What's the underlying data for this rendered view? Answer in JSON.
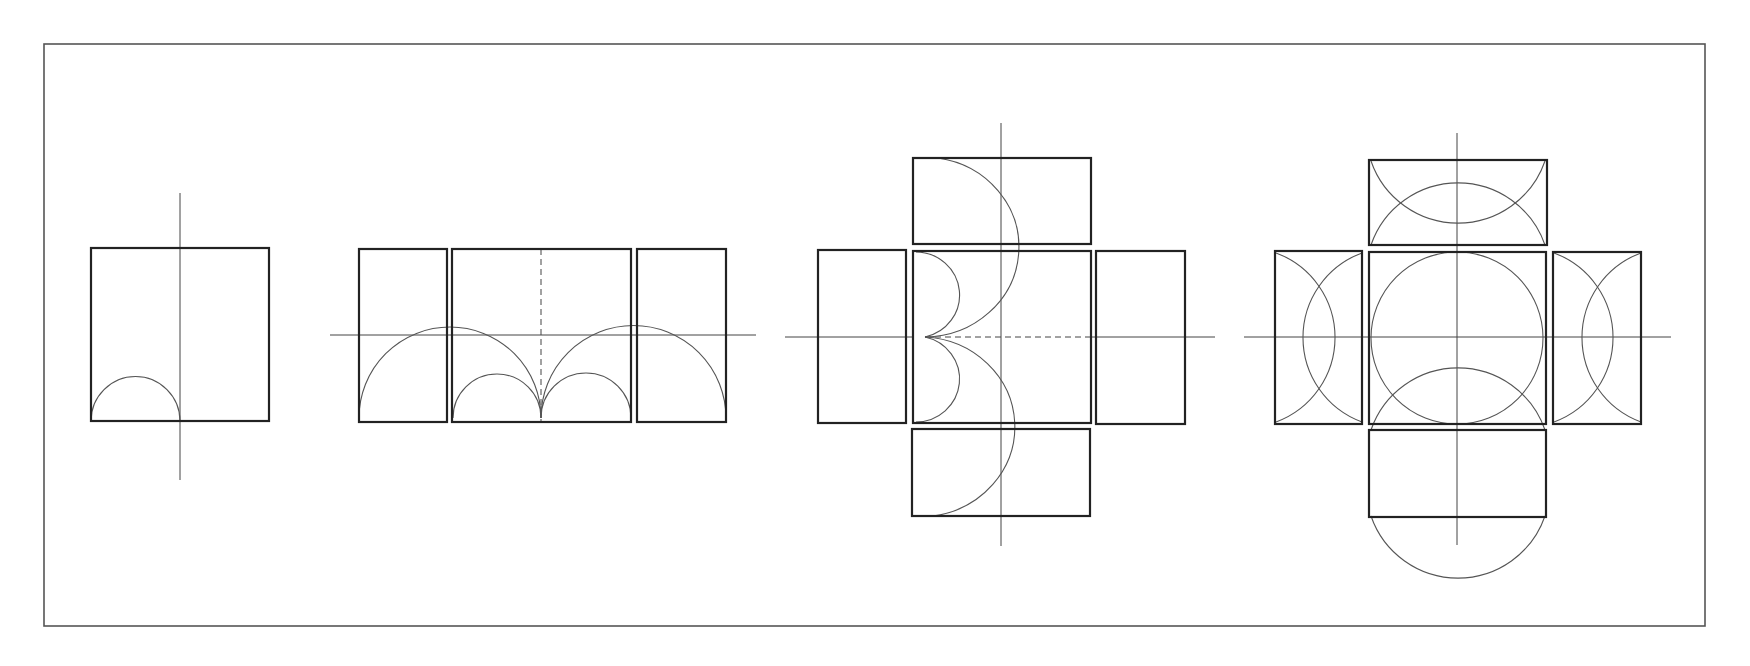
{
  "figure": {
    "title": "Geometric construction: box nets with arcs and circles",
    "frame": {
      "x": 44,
      "y": 44,
      "w": 1661,
      "h": 582
    },
    "panels": [
      {
        "id": "panel-1",
        "label": "single square with half-arc",
        "boxes": [
          {
            "x": 91,
            "y": 248,
            "w": 178,
            "h": 173
          }
        ],
        "axes": [
          {
            "x1": 180,
            "y1": 193,
            "x2": 180,
            "y2": 480,
            "style": "solid"
          }
        ],
        "arcs": [
          "M 91 421 A 44 44 0 0 1 180 421"
        ]
      },
      {
        "id": "panel-2",
        "label": "row of three boxes with semicircles",
        "boxes": [
          {
            "x": 359,
            "y": 249,
            "w": 88,
            "h": 173
          },
          {
            "x": 452,
            "y": 249,
            "w": 179,
            "h": 173
          },
          {
            "x": 637,
            "y": 249,
            "w": 89,
            "h": 173
          }
        ],
        "axes": [
          {
            "x1": 330,
            "y1": 335,
            "x2": 756,
            "y2": 335,
            "style": "solid"
          },
          {
            "x1": 541,
            "y1": 249,
            "x2": 541,
            "y2": 422,
            "style": "dashed"
          }
        ],
        "arcs": [
          "M 359 418 A 91 91 0 0 1 541 418",
          "M 541 418 A 92 92 0 0 1 726 418",
          "M 453 418 A 44 44 0 0 1 541 418",
          "M 541 418 A 45 45 0 0 1 631 418"
        ]
      },
      {
        "id": "panel-3",
        "label": "cross net with side arcs",
        "boxes": [
          {
            "x": 913,
            "y": 158,
            "w": 178,
            "h": 86
          },
          {
            "x": 818,
            "y": 250,
            "w": 88,
            "h": 173
          },
          {
            "x": 913,
            "y": 251,
            "w": 178,
            "h": 172
          },
          {
            "x": 1096,
            "y": 251,
            "w": 89,
            "h": 173
          },
          {
            "x": 912,
            "y": 429,
            "w": 178,
            "h": 87
          }
        ],
        "axes": [
          {
            "x1": 1001,
            "y1": 123,
            "x2": 1001,
            "y2": 546,
            "style": "solid"
          },
          {
            "x1": 785,
            "y1": 337,
            "x2": 913,
            "y2": 337,
            "style": "solid"
          },
          {
            "x1": 925,
            "y1": 337,
            "x2": 1091,
            "y2": 337,
            "style": "dashed"
          },
          {
            "x1": 1091,
            "y1": 337,
            "x2": 1215,
            "y2": 337,
            "style": "solid"
          }
        ],
        "arcs": [
          "M 916 252 A 44 43 0 0 1 925 337",
          "M 925 337 A 44 43 0 0 1 916 422",
          "M 938 158 A 95 90 0 0 1 925 337",
          "M 925 337 A 95 90 0 0 1 933 516"
        ]
      },
      {
        "id": "panel-4",
        "label": "cross net with inscribed circles",
        "boxes": [
          {
            "x": 1369,
            "y": 160,
            "w": 178,
            "h": 85
          },
          {
            "x": 1275,
            "y": 251,
            "w": 87,
            "h": 173
          },
          {
            "x": 1369,
            "y": 252,
            "w": 177,
            "h": 172
          },
          {
            "x": 1553,
            "y": 252,
            "w": 88,
            "h": 172
          },
          {
            "x": 1369,
            "y": 430,
            "w": 177,
            "h": 87
          }
        ],
        "axes": [
          {
            "x1": 1457,
            "y1": 133,
            "x2": 1457,
            "y2": 545,
            "style": "solid"
          },
          {
            "x1": 1244,
            "y1": 337,
            "x2": 1671,
            "y2": 337,
            "style": "solid"
          }
        ],
        "circles": [
          {
            "cx": 1457,
            "cy": 338,
            "r": 86
          }
        ],
        "arcs": [
          "M 1371 245 A 92 92 0 0 1 1545 245",
          "M 1371 161 A 92 92 0 0 0 1545 161",
          "M 1371 430 A 92 92 0 0 1 1545 430",
          "M 1371 516 A 92 92 0 0 0 1545 516",
          "M 1362 253 A 90 90 0 0 0 1362 422",
          "M 1276 253 A 90 90 0 0 1 1276 422",
          "M 1641 253 A 90 90 0 0 0 1641 422",
          "M 1554 253 A 90 90 0 0 1 1554 422"
        ]
      }
    ]
  }
}
